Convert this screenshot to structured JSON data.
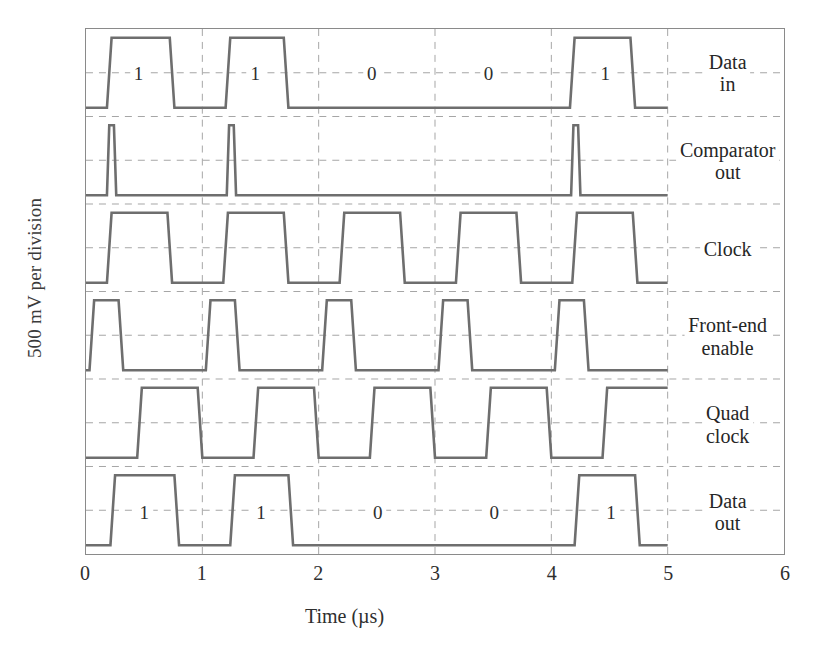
{
  "figure": {
    "ylabel": "500 mV per division",
    "xlabel": "Time (µs)",
    "trace_color": "#6e6e6e",
    "grid_color": "#a6a6a6",
    "frame_color": "#8a8a8a"
  },
  "xaxis": {
    "ticks": [
      "0",
      "1",
      "2",
      "3",
      "4",
      "5",
      "6"
    ],
    "min": 0,
    "max": 6
  },
  "legend": [
    {
      "line1": "Data",
      "line2": "in"
    },
    {
      "line1": "Comparator",
      "line2": "out"
    },
    {
      "line1": "Clock",
      "line2": ""
    },
    {
      "line1": "Front-end",
      "line2": "enable"
    },
    {
      "line1": "Quad",
      "line2": "clock"
    },
    {
      "line1": "Data",
      "line2": "out"
    }
  ],
  "bit_labels": {
    "data_in": [
      {
        "text": "1",
        "t": 0.45
      },
      {
        "text": "1",
        "t": 1.45
      },
      {
        "text": "0",
        "t": 2.45
      },
      {
        "text": "0",
        "t": 3.45
      },
      {
        "text": "1",
        "t": 4.45
      }
    ],
    "data_out": [
      {
        "text": "1",
        "t": 0.5
      },
      {
        "text": "1",
        "t": 1.5
      },
      {
        "text": "0",
        "t": 2.5
      },
      {
        "text": "0",
        "t": 3.5
      },
      {
        "text": "1",
        "t": 4.5
      }
    ]
  },
  "chart_data": {
    "type": "line",
    "title": "",
    "xlabel": "Time (µs)",
    "ylabel": "500 mV per division",
    "xlim": [
      0,
      6
    ],
    "ylim": [
      0,
      6
    ],
    "grid": true,
    "legend_position": "right-inside",
    "x_ticks": [
      0,
      1,
      2,
      3,
      4,
      5,
      6
    ],
    "note": "Oscilloscope capture of six digital timing waveforms; y is 6 divisions of 500 mV each, traces drawn from t=0 to t=5 us.",
    "series": [
      {
        "name": "Data in",
        "row": 0,
        "bits": [
          "1",
          "1",
          "0",
          "0",
          "1"
        ],
        "edges": [
          [
            0.0,
            0
          ],
          [
            0.18,
            0
          ],
          [
            0.22,
            1
          ],
          [
            0.72,
            1
          ],
          [
            0.76,
            0
          ],
          [
            1.2,
            0
          ],
          [
            1.24,
            1
          ],
          [
            1.7,
            1
          ],
          [
            1.74,
            0
          ],
          [
            4.16,
            0
          ],
          [
            4.2,
            1
          ],
          [
            4.68,
            1
          ],
          [
            4.72,
            0
          ],
          [
            5.0,
            0
          ]
        ]
      },
      {
        "name": "Comparator out",
        "row": 1,
        "bits": [],
        "edges": [
          [
            0.0,
            0
          ],
          [
            0.18,
            0
          ],
          [
            0.2,
            1
          ],
          [
            0.24,
            1
          ],
          [
            0.26,
            0
          ],
          [
            1.21,
            0
          ],
          [
            1.23,
            1
          ],
          [
            1.27,
            1
          ],
          [
            1.29,
            0
          ],
          [
            4.17,
            0
          ],
          [
            4.19,
            1
          ],
          [
            4.23,
            1
          ],
          [
            4.25,
            0
          ],
          [
            5.0,
            0
          ]
        ]
      },
      {
        "name": "Clock",
        "row": 2,
        "bits": [],
        "edges": [
          [
            0.0,
            0
          ],
          [
            0.18,
            0
          ],
          [
            0.22,
            1
          ],
          [
            0.7,
            1
          ],
          [
            0.74,
            0
          ],
          [
            1.18,
            0
          ],
          [
            1.22,
            1
          ],
          [
            1.7,
            1
          ],
          [
            1.74,
            0
          ],
          [
            2.18,
            0
          ],
          [
            2.22,
            1
          ],
          [
            2.7,
            1
          ],
          [
            2.74,
            0
          ],
          [
            3.18,
            0
          ],
          [
            3.22,
            1
          ],
          [
            3.7,
            1
          ],
          [
            3.74,
            0
          ],
          [
            4.18,
            0
          ],
          [
            4.22,
            1
          ],
          [
            4.7,
            1
          ],
          [
            4.74,
            0
          ],
          [
            5.0,
            0
          ]
        ]
      },
      {
        "name": "Front-end enable",
        "row": 3,
        "bits": [],
        "edges": [
          [
            0.0,
            0
          ],
          [
            0.03,
            0
          ],
          [
            0.07,
            1
          ],
          [
            0.28,
            1
          ],
          [
            0.32,
            0
          ],
          [
            1.03,
            0
          ],
          [
            1.07,
            1
          ],
          [
            1.28,
            1
          ],
          [
            1.32,
            0
          ],
          [
            2.03,
            0
          ],
          [
            2.07,
            1
          ],
          [
            2.28,
            1
          ],
          [
            2.32,
            0
          ],
          [
            3.03,
            0
          ],
          [
            3.07,
            1
          ],
          [
            3.28,
            1
          ],
          [
            3.32,
            0
          ],
          [
            4.03,
            0
          ],
          [
            4.07,
            1
          ],
          [
            4.28,
            1
          ],
          [
            4.32,
            0
          ],
          [
            5.0,
            0
          ]
        ]
      },
      {
        "name": "Quad clock",
        "row": 4,
        "bits": [],
        "edges": [
          [
            0.0,
            0
          ],
          [
            0.44,
            0
          ],
          [
            0.48,
            1
          ],
          [
            0.96,
            1
          ],
          [
            1.0,
            0
          ],
          [
            1.44,
            0
          ],
          [
            1.48,
            1
          ],
          [
            1.96,
            1
          ],
          [
            2.0,
            0
          ],
          [
            2.44,
            0
          ],
          [
            2.48,
            1
          ],
          [
            2.96,
            1
          ],
          [
            3.0,
            0
          ],
          [
            3.44,
            0
          ],
          [
            3.48,
            1
          ],
          [
            3.96,
            1
          ],
          [
            4.0,
            0
          ],
          [
            4.44,
            0
          ],
          [
            4.48,
            1
          ],
          [
            4.96,
            1
          ],
          [
            5.0,
            1
          ]
        ]
      },
      {
        "name": "Data out",
        "row": 5,
        "bits": [
          "1",
          "1",
          "0",
          "0",
          "1"
        ],
        "edges": [
          [
            0.0,
            0
          ],
          [
            0.21,
            0
          ],
          [
            0.25,
            1
          ],
          [
            0.76,
            1
          ],
          [
            0.8,
            0
          ],
          [
            1.24,
            0
          ],
          [
            1.28,
            1
          ],
          [
            1.74,
            1
          ],
          [
            1.78,
            0
          ],
          [
            4.2,
            0
          ],
          [
            4.24,
            1
          ],
          [
            4.72,
            1
          ],
          [
            4.76,
            0
          ],
          [
            5.0,
            0
          ]
        ]
      }
    ]
  }
}
